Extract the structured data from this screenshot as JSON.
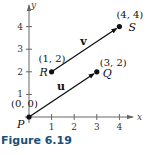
{
  "caption": "Figure 6.19",
  "colors": {
    "caption": "#1a4f7a",
    "ink": "#111111",
    "axis": "#555555"
  },
  "chart_data": {
    "type": "scatter",
    "title": "",
    "xlabel": "x",
    "ylabel": "y",
    "xlim": [
      0,
      4.6
    ],
    "ylim": [
      0,
      5.0
    ],
    "x_ticks": [
      1,
      2,
      3,
      4
    ],
    "y_ticks": [
      1,
      2,
      3,
      4
    ],
    "x_tick_labels": [
      "1",
      "2",
      "3",
      "4"
    ],
    "y_tick_labels": [
      "1",
      "2",
      "3",
      "4"
    ],
    "grid": false,
    "points": [
      {
        "name": "P",
        "x": 0,
        "y": 0,
        "coord_label": "(0, 0)"
      },
      {
        "name": "Q",
        "x": 3,
        "y": 2,
        "coord_label": "(3, 2)"
      },
      {
        "name": "R",
        "x": 1,
        "y": 2,
        "coord_label": "(1, 2)"
      },
      {
        "name": "S",
        "x": 4,
        "y": 4,
        "coord_label": "(4, 4)"
      }
    ],
    "vectors": [
      {
        "name": "u",
        "from": "P",
        "to": "Q"
      },
      {
        "name": "v",
        "from": "R",
        "to": "S"
      }
    ]
  }
}
